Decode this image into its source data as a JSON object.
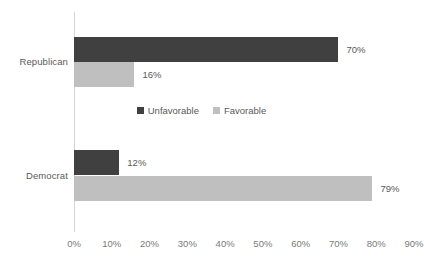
{
  "chart_data": {
    "type": "bar",
    "orientation": "horizontal",
    "title": "",
    "subtitle": "",
    "xlabel": "",
    "ylabel": "",
    "xlim": [
      0,
      90
    ],
    "xticks": [
      "0%",
      "10%",
      "20%",
      "30%",
      "40%",
      "50%",
      "60%",
      "70%",
      "80%",
      "90%"
    ],
    "xtick_values": [
      0,
      10,
      20,
      30,
      40,
      50,
      60,
      70,
      80,
      90
    ],
    "grid": false,
    "legend_position": "center-middle",
    "categories": [
      "Republican",
      "Democrat"
    ],
    "series": [
      {
        "name": "Unfavorable",
        "color": "#404040",
        "values": [
          70,
          12
        ],
        "labels": [
          "70%",
          "12%"
        ]
      },
      {
        "name": "Favorable",
        "color": "#BFBFBF",
        "values": [
          16,
          79
        ],
        "labels": [
          "16%",
          "79%"
        ]
      }
    ],
    "colors": {
      "unfavorable": "#404040",
      "favorable": "#BFBFBF",
      "axis": "#D4D4D4",
      "text": "#5A5A5A",
      "tick_text": "#7A7A7A",
      "background": "#FFFFFF"
    }
  },
  "axis": {
    "ticks": [
      {
        "label": "0%",
        "value": 0
      },
      {
        "label": "10%",
        "value": 10
      },
      {
        "label": "20%",
        "value": 20
      },
      {
        "label": "30%",
        "value": 30
      },
      {
        "label": "40%",
        "value": 40
      },
      {
        "label": "50%",
        "value": 50
      },
      {
        "label": "60%",
        "value": 60
      },
      {
        "label": "70%",
        "value": 70
      },
      {
        "label": "80%",
        "value": 80
      },
      {
        "label": "90%",
        "value": 90
      }
    ]
  },
  "categories": {
    "republican": "Republican",
    "democrat": "Democrat"
  },
  "legend": {
    "items": [
      {
        "label": "Unfavorable",
        "color": "#404040"
      },
      {
        "label": "Favorable",
        "color": "#BFBFBF"
      }
    ]
  },
  "values": {
    "republican_unfavorable": "70%",
    "republican_favorable": "16%",
    "democrat_unfavorable": "12%",
    "democrat_favorable": "79%"
  }
}
